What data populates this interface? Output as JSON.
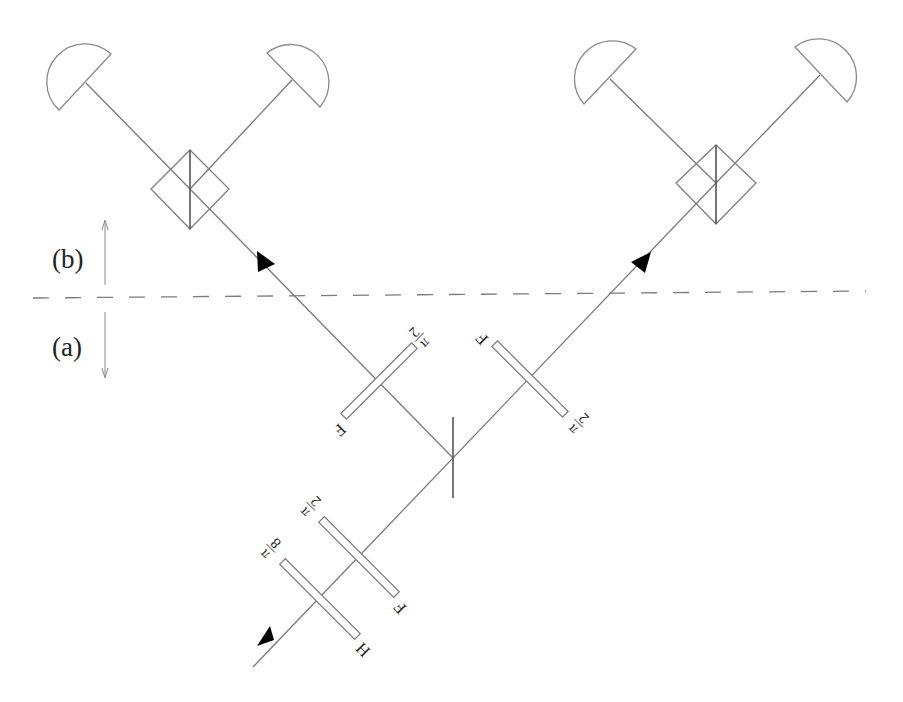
{
  "figure": {
    "regions": [
      {
        "id": "b",
        "label": "(b)",
        "direction": "up"
      },
      {
        "id": "a",
        "label": "(a)",
        "direction": "down"
      }
    ],
    "boundary": "dashed-line"
  },
  "components": {
    "input_plates": [
      {
        "id": "plate-pi-8",
        "fraction": {
          "num": "π",
          "den": "8"
        },
        "axis_label": "H"
      },
      {
        "id": "plate-pi-2-lower",
        "fraction": {
          "num": "π",
          "den": "2"
        },
        "axis_label": "F"
      }
    ],
    "central_splitter": {
      "type": "polarizing-beam-splitter"
    },
    "arm_plates": [
      {
        "id": "plate-left-arm",
        "fraction": {
          "num": "π",
          "den": "2"
        },
        "axis_label": "F"
      },
      {
        "id": "plate-right-arm",
        "fraction": {
          "num": "π",
          "den": "2"
        },
        "axis_label": "F"
      }
    ],
    "analyzers": [
      {
        "id": "left-analyzer",
        "detectors": 2
      },
      {
        "id": "right-analyzer",
        "detectors": 2
      }
    ]
  },
  "colors": {
    "line": "#7a7a7a",
    "arrowhead": "#000000",
    "background": "#ffffff"
  }
}
